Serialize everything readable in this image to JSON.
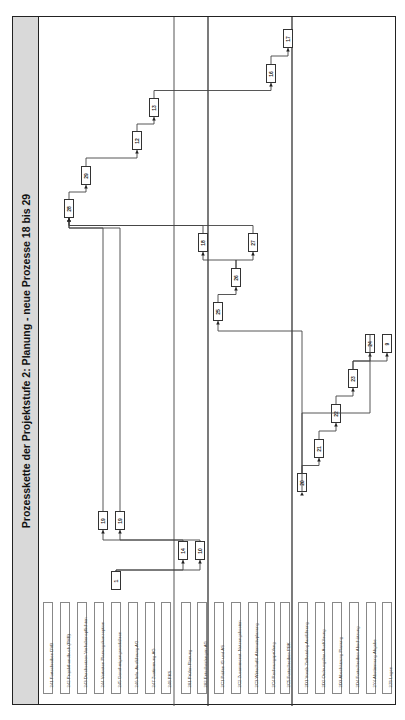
{
  "title": "Prozesskette der Projektstufe 2: Planung - neue Prozesse 18 bis 29",
  "labels": [
    {
      "id": "241",
      "text": "241 Fortschreiben DVB"
    },
    {
      "id": "242",
      "text": "242 Projekthandbuch (PHB)"
    },
    {
      "id": "243",
      "text": "243 Durchsetzen Vorhabenspflichten"
    },
    {
      "id": "244",
      "text": "244 Vertreten Planungskonzeption"
    },
    {
      "id": "245",
      "text": "245 Genehmigungsverfahren"
    },
    {
      "id": "246",
      "text": "246 Info. Ausführung AG"
    },
    {
      "id": "247",
      "text": "247 Zustimmung AG"
    },
    {
      "id": "248",
      "text": "248 PKS"
    },
    {
      "id": "281",
      "text": "281 Prüfen Planung"
    },
    {
      "id": "282",
      "text": "282 Entscheidungen AG"
    },
    {
      "id": "2C1",
      "text": "2C1 Prüfen IG und AS"
    },
    {
      "id": "2C2",
      "text": "2C2 Zusammenst. Nutzungskosten"
    },
    {
      "id": "2C3",
      "text": "2C3 Wirtschaftl. Alternativplanung"
    },
    {
      "id": "2C4",
      "text": "2C4 Rechnungsprüfung"
    },
    {
      "id": "2C5",
      "text": "2C5 Fortschreiben PBK"
    },
    {
      "id": "2D1",
      "text": "2D1 Vorab-Zielkatalog Ausführung"
    },
    {
      "id": "2D2",
      "text": "2D2 Ordnungsbau Ausführung"
    },
    {
      "id": "2D3",
      "text": "2D3 Abschätzung Planung"
    },
    {
      "id": "2D4",
      "text": "2D4 Fortschreiben Abschätzung"
    },
    {
      "id": "2Y4",
      "text": "2Y4 Abstimmung Abgabe"
    },
    {
      "id": "2Z6",
      "text": "2Z6 Lagen"
    }
  ],
  "processes": [
    {
      "id": "p1",
      "num": "1",
      "x": 110,
      "y": 570,
      "shaded": false
    },
    {
      "id": "p14",
      "num": "14",
      "x": 177,
      "y": 540,
      "shaded": false
    },
    {
      "id": "p10",
      "num": "10",
      "x": 194,
      "y": 540,
      "shaded": true
    },
    {
      "id": "p19a",
      "num": "19",
      "x": 97,
      "y": 510,
      "shaded": true
    },
    {
      "id": "p19b",
      "num": "19",
      "x": 114,
      "y": 510,
      "shaded": true
    },
    {
      "id": "p28",
      "num": "28",
      "x": 63,
      "y": 198,
      "shaded": true
    },
    {
      "id": "p29",
      "num": "29",
      "x": 80,
      "y": 165,
      "shaded": true
    },
    {
      "id": "p12",
      "num": "12",
      "x": 131,
      "y": 130,
      "shaded": false
    },
    {
      "id": "p13",
      "num": "13",
      "x": 148,
      "y": 97,
      "shaded": false
    },
    {
      "id": "p16",
      "num": "16",
      "x": 265,
      "y": 63,
      "shaded": false
    },
    {
      "id": "p17",
      "num": "17",
      "x": 282,
      "y": 28,
      "shaded": false
    },
    {
      "id": "p18",
      "num": "18",
      "x": 197,
      "y": 232,
      "shaded": false
    },
    {
      "id": "p27",
      "num": "27",
      "x": 247,
      "y": 232,
      "shaded": true
    },
    {
      "id": "p26",
      "num": "26",
      "x": 230,
      "y": 267,
      "shaded": true
    },
    {
      "id": "p25",
      "num": "25",
      "x": 212,
      "y": 301,
      "shaded": true
    },
    {
      "id": "p20",
      "num": "20",
      "x": 296,
      "y": 472,
      "shaded": true
    },
    {
      "id": "p21",
      "num": "21",
      "x": 313,
      "y": 438,
      "shaded": true
    },
    {
      "id": "p22",
      "num": "22",
      "x": 330,
      "y": 403,
      "shaded": true
    },
    {
      "id": "p23",
      "num": "23",
      "x": 347,
      "y": 368,
      "shaded": true
    },
    {
      "id": "p24",
      "num": "24",
      "x": 364,
      "y": 333,
      "shaded": true
    },
    {
      "id": "p9",
      "num": "9",
      "x": 381,
      "y": 333,
      "shaded": false
    }
  ]
}
